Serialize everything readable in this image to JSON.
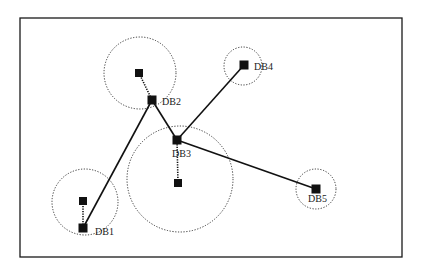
{
  "diagram": {
    "frame": {
      "x": 20,
      "y": 18,
      "w": 382,
      "h": 239,
      "stroke": "#1a1a1a"
    },
    "colors": {
      "ink": "#111111",
      "dotted": "#333333",
      "background": "#ffffff"
    },
    "databases": [
      {
        "id": "DB1",
        "label": "DB1",
        "node": [
          83,
          228
        ],
        "label_pos": [
          95,
          235
        ],
        "circle": {
          "cx": 85,
          "cy": 202,
          "r": 33
        },
        "satellite": [
          83,
          201
        ]
      },
      {
        "id": "DB2",
        "label": "DB2",
        "node": [
          152,
          100
        ],
        "label_pos": [
          162,
          105
        ],
        "circle": {
          "cx": 140,
          "cy": 73,
          "r": 36
        },
        "satellite": [
          139,
          73
        ]
      },
      {
        "id": "DB3",
        "label": "DB3",
        "node": [
          177,
          140
        ],
        "label_pos": [
          172,
          157
        ],
        "circle": {
          "cx": 180,
          "cy": 179,
          "r": 53
        },
        "satellite": [
          178,
          183
        ]
      },
      {
        "id": "DB4",
        "label": "DB4",
        "node": [
          244,
          65
        ],
        "label_pos": [
          254,
          70
        ],
        "circle": {
          "cx": 243,
          "cy": 66,
          "r": 19
        },
        "satellite": null
      },
      {
        "id": "DB5",
        "label": "DB5",
        "node": [
          316,
          189
        ],
        "label_pos": [
          308,
          202
        ],
        "circle": {
          "cx": 316,
          "cy": 189,
          "r": 20
        },
        "satellite": null
      }
    ],
    "links": [
      {
        "from": "DB1",
        "to": "DB2"
      },
      {
        "from": "DB2",
        "to": "DB3"
      },
      {
        "from": "DB3",
        "to": "DB4"
      },
      {
        "from": "DB3",
        "to": "DB5"
      }
    ]
  }
}
